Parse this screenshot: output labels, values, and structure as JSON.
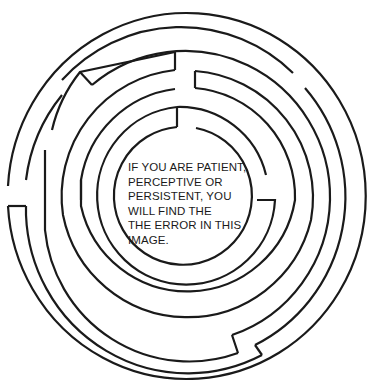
{
  "puzzle": {
    "type": "circular-maze",
    "message_lines": [
      "IF YOU ARE PATIENT,",
      "PERCEPTIVE OR",
      "PERSISTENT, YOU",
      "WILL FIND THE",
      "THE ERROR IN THIS",
      "IMAGE."
    ]
  },
  "colors": {
    "background": "#ffffff",
    "line": "#1a1a1a"
  }
}
